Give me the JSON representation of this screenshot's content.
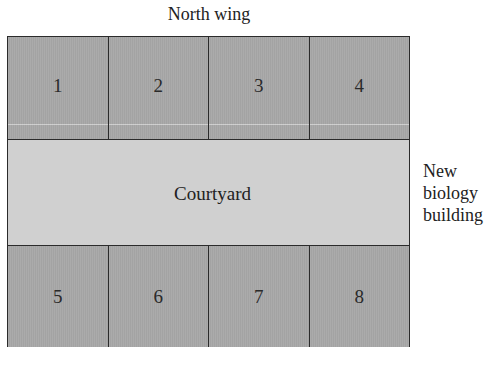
{
  "diagram": {
    "north_label": "North wing",
    "courtyard_label": "Courtyard",
    "building_label_lines": [
      "New",
      "biology",
      "building"
    ],
    "north_lots": [
      "1",
      "2",
      "3",
      "4"
    ],
    "south_lots": [
      "5",
      "6",
      "7",
      "8"
    ],
    "colors": {
      "lot_fill": "#a8a8a8",
      "courtyard_fill": "#d0d0d0",
      "outline": "#2b2b2b",
      "text": "#222222"
    }
  }
}
